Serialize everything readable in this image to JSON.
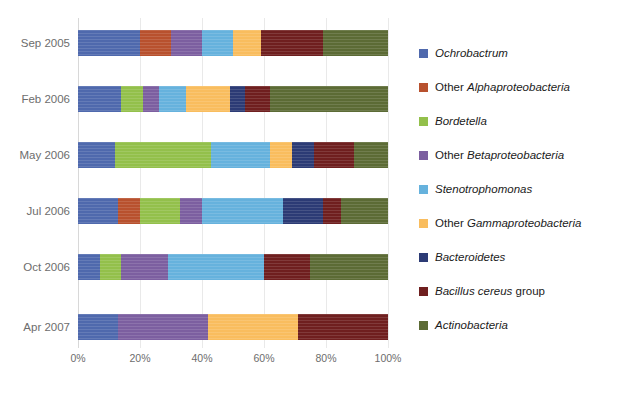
{
  "chart_data": {
    "type": "bar",
    "orientation": "horizontal",
    "stacked": true,
    "normalized": true,
    "title": "",
    "xlabel": "",
    "ylabel": "",
    "xlim": [
      0,
      100
    ],
    "grid": true,
    "legend_position": "right",
    "categories": [
      "Sep 2005",
      "Feb 2006",
      "May 2006",
      "Jul 2006",
      "Oct 2006",
      "Apr 2007"
    ],
    "xticks": [
      "0%",
      "20%",
      "40%",
      "60%",
      "80%",
      "100%"
    ],
    "xtick_values": [
      0,
      20,
      40,
      60,
      80,
      100
    ],
    "series": [
      {
        "name": "Ochrobactrum",
        "italic_prefix": "Ochrobactrum",
        "plain_suffix": "",
        "color": "#4f69ad",
        "values": [
          20,
          14,
          12,
          13,
          7,
          13
        ]
      },
      {
        "name": "Other Alphaproteobacteria",
        "italic_prefix": "",
        "plain_prefix": "Other ",
        "italic_word": "Alphaproteobacteria",
        "color": "#b8512e",
        "values": [
          10,
          0,
          0,
          7,
          0,
          0
        ]
      },
      {
        "name": "Bordetella",
        "italic_prefix": "Bordetella",
        "plain_suffix": "",
        "color": "#93c04b",
        "values": [
          0,
          7,
          31,
          13,
          7,
          0
        ]
      },
      {
        "name": "Other Betaproteobacteria",
        "plain_prefix": "Other ",
        "italic_word": "Betaproteobacteria",
        "color": "#7c5fa0",
        "values": [
          10,
          5,
          0,
          7,
          15,
          29
        ]
      },
      {
        "name": "Stenotrophomonas",
        "italic_prefix": "Stenotrophomonas",
        "plain_suffix": "",
        "color": "#66b2dd",
        "values": [
          10,
          9,
          19,
          26,
          31,
          0
        ]
      },
      {
        "name": "Other Gammaproteobacteria",
        "plain_prefix": "Other ",
        "italic_word": "Gammaproteobacteria",
        "color": "#f9bd5e",
        "values": [
          9,
          14,
          7,
          0,
          0,
          29
        ]
      },
      {
        "name": "Bacteroidetes",
        "italic_prefix": "Bacteroidetes",
        "plain_suffix": "",
        "color": "#2c3b75",
        "values": [
          0,
          5,
          7,
          13,
          0,
          0
        ]
      },
      {
        "name": "Bacillus cereus group",
        "italic_word_first": "Bacillus cereus",
        "plain_suffix": " group",
        "color": "#6f1f1f",
        "values": [
          20,
          8,
          13,
          6,
          15,
          29
        ]
      },
      {
        "name": "Actinobacteria",
        "italic_prefix": "Actinobacteria",
        "plain_suffix": "",
        "color": "#5c6b35",
        "values": [
          21,
          38,
          11,
          15,
          25,
          0
        ]
      }
    ],
    "stacks": [
      {
        "category": "Sep 2005",
        "segments": [
          {
            "series": "Ochrobactrum",
            "value": 20,
            "color": "#4f69ad"
          },
          {
            "series": "Other Alphaproteobacteria",
            "value": 10,
            "color": "#b8512e"
          },
          {
            "series": "Other Betaproteobacteria",
            "value": 10,
            "color": "#7c5fa0"
          },
          {
            "series": "Stenotrophomonas",
            "value": 10,
            "color": "#66b2dd"
          },
          {
            "series": "Other Gammaproteobacteria",
            "value": 9,
            "color": "#f9bd5e"
          },
          {
            "series": "Bacillus cereus group",
            "value": 20,
            "color": "#6f1f1f"
          },
          {
            "series": "Actinobacteria",
            "value": 21,
            "color": "#5c6b35"
          }
        ]
      },
      {
        "category": "Feb 2006",
        "segments": [
          {
            "series": "Ochrobactrum",
            "value": 14,
            "color": "#4f69ad"
          },
          {
            "series": "Bordetella",
            "value": 7,
            "color": "#93c04b"
          },
          {
            "series": "Other Betaproteobacteria",
            "value": 5,
            "color": "#7c5fa0"
          },
          {
            "series": "Stenotrophomonas",
            "value": 9,
            "color": "#66b2dd"
          },
          {
            "series": "Other Gammaproteobacteria",
            "value": 14,
            "color": "#f9bd5e"
          },
          {
            "series": "Bacteroidetes",
            "value": 5,
            "color": "#2c3b75"
          },
          {
            "series": "Bacillus cereus group",
            "value": 8,
            "color": "#6f1f1f"
          },
          {
            "series": "Actinobacteria",
            "value": 38,
            "color": "#5c6b35"
          }
        ]
      },
      {
        "category": "May 2006",
        "segments": [
          {
            "series": "Ochrobactrum",
            "value": 12,
            "color": "#4f69ad"
          },
          {
            "series": "Bordetella",
            "value": 31,
            "color": "#93c04b"
          },
          {
            "series": "Stenotrophomonas",
            "value": 19,
            "color": "#66b2dd"
          },
          {
            "series": "Other Gammaproteobacteria",
            "value": 7,
            "color": "#f9bd5e"
          },
          {
            "series": "Bacteroidetes",
            "value": 7,
            "color": "#2c3b75"
          },
          {
            "series": "Bacillus cereus group",
            "value": 13,
            "color": "#6f1f1f"
          },
          {
            "series": "Actinobacteria",
            "value": 11,
            "color": "#5c6b35"
          }
        ]
      },
      {
        "category": "Jul 2006",
        "segments": [
          {
            "series": "Ochrobactrum",
            "value": 13,
            "color": "#4f69ad"
          },
          {
            "series": "Other Alphaproteobacteria",
            "value": 7,
            "color": "#b8512e"
          },
          {
            "series": "Bordetella",
            "value": 13,
            "color": "#93c04b"
          },
          {
            "series": "Other Betaproteobacteria",
            "value": 7,
            "color": "#7c5fa0"
          },
          {
            "series": "Stenotrophomonas",
            "value": 26,
            "color": "#66b2dd"
          },
          {
            "series": "Bacteroidetes",
            "value": 13,
            "color": "#2c3b75"
          },
          {
            "series": "Bacillus cereus group",
            "value": 6,
            "color": "#6f1f1f"
          },
          {
            "series": "Actinobacteria",
            "value": 15,
            "color": "#5c6b35"
          }
        ]
      },
      {
        "category": "Oct 2006",
        "segments": [
          {
            "series": "Ochrobactrum",
            "value": 7,
            "color": "#4f69ad"
          },
          {
            "series": "Bordetella",
            "value": 7,
            "color": "#93c04b"
          },
          {
            "series": "Other Betaproteobacteria",
            "value": 15,
            "color": "#7c5fa0"
          },
          {
            "series": "Stenotrophomonas",
            "value": 31,
            "color": "#66b2dd"
          },
          {
            "series": "Bacillus cereus group",
            "value": 15,
            "color": "#6f1f1f"
          },
          {
            "series": "Actinobacteria",
            "value": 25,
            "color": "#5c6b35"
          }
        ]
      },
      {
        "category": "Apr 2007",
        "segments": [
          {
            "series": "Ochrobactrum",
            "value": 13,
            "color": "#4f69ad"
          },
          {
            "series": "Other Betaproteobacteria",
            "value": 29,
            "color": "#7c5fa0"
          },
          {
            "series": "Other Gammaproteobacteria",
            "value": 29,
            "color": "#f9bd5e"
          },
          {
            "series": "Bacillus cereus group",
            "value": 29,
            "color": "#6f1f1f"
          }
        ]
      }
    ]
  },
  "legend": {
    "items": [
      {
        "label": "Ochrobactrum",
        "color": "#4f69ad",
        "style": "italic"
      },
      {
        "label": "Other Alphaproteobacteria",
        "color": "#b8512e",
        "style": "mixed",
        "plain": "Other ",
        "italic": "Alphaproteobacteria"
      },
      {
        "label": "Bordetella",
        "color": "#93c04b",
        "style": "italic"
      },
      {
        "label": "Other Betaproteobacteria",
        "color": "#7c5fa0",
        "style": "mixed",
        "plain": "Other ",
        "italic": "Betaproteobacteria"
      },
      {
        "label": "Stenotrophomonas",
        "color": "#66b2dd",
        "style": "italic"
      },
      {
        "label": "Other Gammaproteobacteria",
        "color": "#f9bd5e",
        "style": "mixed",
        "plain": "Other ",
        "italic": "Gammaproteobacteria"
      },
      {
        "label": "Bacteroidetes",
        "color": "#2c3b75",
        "style": "italic"
      },
      {
        "label": "Bacillus cereus group",
        "color": "#6f1f1f",
        "style": "mixed-suffix",
        "italic": "Bacillus cereus",
        "plain": " group"
      },
      {
        "label": "Actinobacteria",
        "color": "#5c6b35",
        "style": "italic"
      }
    ]
  }
}
